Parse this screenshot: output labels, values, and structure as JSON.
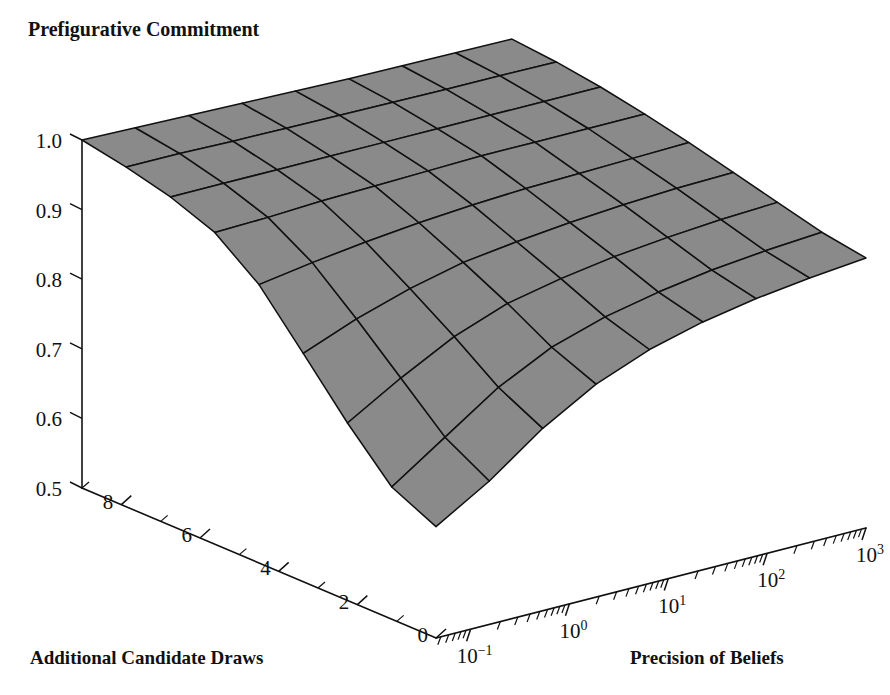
{
  "figure": {
    "title": "Prefigurative Commitment",
    "background_color": "#ffffff",
    "ink_color": "#111111",
    "surface_fill": "#8a8a8a",
    "surface_edge": "#111111"
  },
  "axes": {
    "z": {
      "title": "Prefigurative Commitment",
      "ticks": [
        "1.0",
        "0.9",
        "0.8",
        "0.7",
        "0.6",
        "0.5"
      ],
      "tick_values": [
        1.0,
        0.9,
        0.8,
        0.7,
        0.6,
        0.5
      ],
      "range": [
        0.5,
        1.0
      ]
    },
    "y": {
      "title": "Additional Candidate Draws",
      "ticks": [
        "8",
        "6",
        "4",
        "2",
        "0"
      ],
      "tick_values": [
        8,
        6,
        4,
        2,
        0
      ],
      "minor_tick_values": [
        9,
        7,
        5,
        3,
        1
      ],
      "range": [
        0,
        9
      ]
    },
    "x": {
      "title": "Precision of Beliefs",
      "scale": "log",
      "ticks": [
        "10-1",
        "100",
        "101",
        "102",
        "103"
      ],
      "tick_mantissa": [
        "10",
        "10",
        "10",
        "10",
        "10"
      ],
      "tick_exponent": [
        "−1",
        "0",
        "1",
        "2",
        "3"
      ],
      "tick_values": [
        -1,
        0,
        1,
        2,
        3
      ],
      "range": [
        -1.35,
        3.0
      ]
    }
  },
  "chart_data": {
    "type": "surface",
    "title": "Prefigurative Commitment",
    "xlabel": "Precision of Beliefs",
    "ylabel": "Additional Candidate Draws",
    "zlabel": "Prefigurative Commitment",
    "xlabel_scale": "log10",
    "x": [
      -1.35,
      -0.81,
      -0.27,
      0.27,
      0.81,
      1.35,
      1.89,
      2.43,
      3.0
    ],
    "y": [
      0,
      1.125,
      2.25,
      3.375,
      4.5,
      5.625,
      6.75,
      7.875,
      9
    ],
    "zlim": [
      0.5,
      1.0
    ],
    "grid": false,
    "legend": "none",
    "z": [
      [
        0.66,
        0.706,
        0.762,
        0.806,
        0.836,
        0.856,
        0.87,
        0.88,
        0.888
      ],
      [
        0.69,
        0.742,
        0.794,
        0.832,
        0.856,
        0.872,
        0.884,
        0.892,
        0.898
      ],
      [
        0.755,
        0.8,
        0.84,
        0.868,
        0.884,
        0.896,
        0.904,
        0.91,
        0.914
      ],
      [
        0.828,
        0.858,
        0.882,
        0.9,
        0.91,
        0.918,
        0.924,
        0.928,
        0.93
      ],
      [
        0.9,
        0.912,
        0.922,
        0.93,
        0.936,
        0.94,
        0.942,
        0.944,
        0.946
      ],
      [
        0.948,
        0.95,
        0.954,
        0.956,
        0.958,
        0.96,
        0.96,
        0.96,
        0.96
      ],
      [
        0.972,
        0.972,
        0.972,
        0.972,
        0.972,
        0.972,
        0.972,
        0.972,
        0.972
      ],
      [
        0.988,
        0.988,
        0.986,
        0.985,
        0.984,
        0.983,
        0.982,
        0.982,
        0.981
      ],
      [
        1.0,
        0.998,
        0.996,
        0.994,
        0.992,
        0.99,
        0.989,
        0.988,
        0.987
      ]
    ]
  }
}
